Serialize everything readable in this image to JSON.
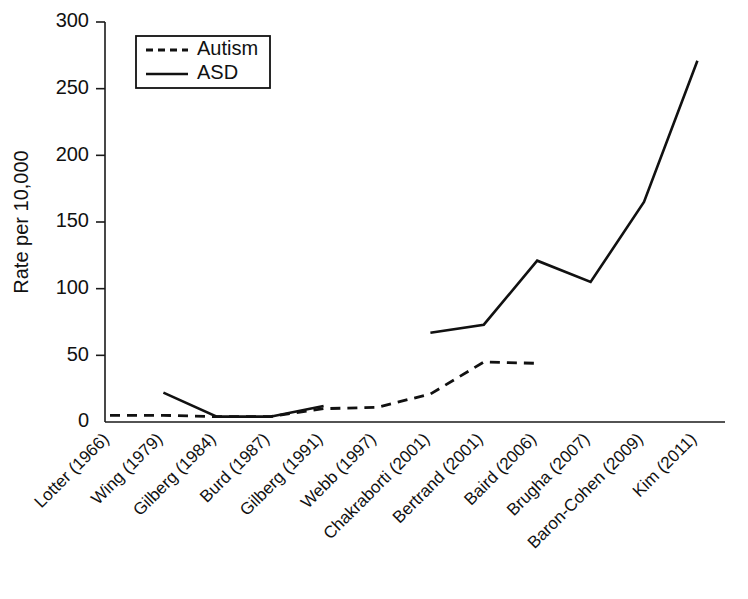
{
  "chart_data": {
    "type": "line",
    "title": "",
    "xlabel": "",
    "ylabel": "Rate per 10,000",
    "ylim": [
      0,
      300
    ],
    "yticks": [
      0,
      50,
      100,
      150,
      200,
      250,
      300
    ],
    "ytick_labels": [
      "0",
      "50",
      "100",
      "150",
      "200",
      "250",
      "300"
    ],
    "grid": false,
    "legend_position": "upper left",
    "categories": [
      "Lotter (1966)",
      "Wing (1979)",
      "Gilberg (1984)",
      "Burd (1987)",
      "Gilberg (1991)",
      "Webb (1997)",
      "Chakraborti (2001)",
      "Bertrand (2001)",
      "Baird (2006)",
      "Brugha (2007)",
      "Baron-Cohen (2009)",
      "Kim (2011)"
    ],
    "series": [
      {
        "name": "Autism",
        "style": "dashed",
        "color": "#111111",
        "values": [
          5,
          5,
          4,
          4,
          10,
          11,
          21,
          45,
          44,
          null,
          null,
          null
        ]
      },
      {
        "name": "ASD",
        "style": "solid",
        "color": "#111111",
        "values": [
          null,
          22,
          4,
          4,
          12,
          null,
          67,
          73,
          121,
          105,
          165,
          271
        ]
      }
    ],
    "legend_entries": [
      {
        "label": "Autism",
        "style": "dashed"
      },
      {
        "label": "ASD",
        "style": "solid"
      }
    ]
  },
  "plot_geometry": {
    "left": 105,
    "right": 725,
    "top": 22,
    "bottom": 422,
    "first_category_x": 110,
    "category_spacing": 53.4,
    "xlabel_rotation": -45
  },
  "legend_geometry": {
    "x": 136,
    "y": 36,
    "width": 134,
    "height": 52
  }
}
